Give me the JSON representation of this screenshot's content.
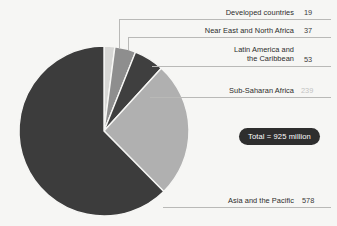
{
  "chart_data": {
    "type": "pie",
    "title": "",
    "subtitle": "",
    "xlabel": "",
    "ylabel": "",
    "grid": false,
    "legend_position": "callout-labels-right",
    "unit": "million",
    "total": 925,
    "total_label": "Total = 925 million",
    "categories": [
      "Developed countries",
      "Near East and North Africa",
      "Latin America and\nthe Caribbean",
      "Sub-Saharan Africa",
      "Asia and the Pacific"
    ],
    "values": [
      19,
      37,
      53,
      239,
      578
    ],
    "colors": [
      "#d7d7d5",
      "#8e8e8e",
      "#3f3f3f",
      "#b0b0b0",
      "#3c3c3c"
    ],
    "annotations": [
      "Total = 925 million"
    ]
  },
  "slices": [
    {
      "label": "Developed countries",
      "value": "19",
      "color": "#d7d7d5",
      "label_left": 196,
      "label_top": 19,
      "label_width": 98,
      "value_left": 304,
      "leader": {
        "x": 183,
        "y": 19,
        "w": 148,
        "drop_x": 119,
        "drop_y": 48
      }
    },
    {
      "label": "Near East and North Africa",
      "value": "37",
      "color": "#8e8e8e",
      "label_left": 176,
      "label_top": 37,
      "label_width": 118,
      "value_left": 304,
      "leader": {
        "x": 162,
        "y": 37,
        "w": 169,
        "drop_x": 128,
        "drop_y": 50
      }
    },
    {
      "label": "Latin America and\nthe Caribbean",
      "value": "53",
      "color": "#3f3f3f",
      "label_left": 176,
      "label_top": 66,
      "label_width": 118,
      "value_left": 304,
      "leader": {
        "x": 152,
        "y": 66,
        "w": 179,
        "drop_x": 152,
        "drop_y": 66
      }
    },
    {
      "label": "Sub-Saharan Africa",
      "value": "239",
      "color": "#b0b0b0",
      "faded_value": true,
      "label_left": 196,
      "label_top": 97,
      "label_width": 98,
      "value_left": 301,
      "leader": {
        "x": 150,
        "y": 97,
        "w": 181,
        "drop_x": 150,
        "drop_y": 97
      }
    },
    {
      "label": "Asia and the Pacific",
      "value": "578",
      "color": "#3c3c3c",
      "label_left": 196,
      "label_top": 207,
      "label_width": 98,
      "value_left": 302,
      "leader": {
        "x": 163,
        "y": 207,
        "w": 168,
        "drop_x": 163,
        "drop_y": 207
      }
    }
  ],
  "pie": {
    "center_x": 104,
    "center_y": 131,
    "radius": 85,
    "start_angle_deg": -90
  }
}
